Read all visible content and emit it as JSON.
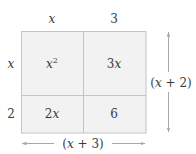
{
  "diagram": {
    "colors": {
      "cell_fill": "#f2f2f2",
      "grid_stroke": "#c4c4c4",
      "arrow_stroke": "#a8a8a8",
      "text": "#3a3a3a",
      "background": "#ffffff"
    },
    "column_headers": [
      {
        "text": "x",
        "italic": true
      },
      {
        "text": "3",
        "italic": false
      }
    ],
    "row_headers": [
      {
        "text": "x",
        "italic": true
      },
      {
        "text": "2",
        "italic": false
      }
    ],
    "cells": [
      {
        "row": 0,
        "col": 0,
        "coef": "",
        "var": "x",
        "sup": "2"
      },
      {
        "row": 0,
        "col": 1,
        "coef": "3",
        "var": "x",
        "sup": ""
      },
      {
        "row": 1,
        "col": 0,
        "coef": "2",
        "var": "x",
        "sup": ""
      },
      {
        "row": 1,
        "col": 1,
        "coef": "6",
        "var": "",
        "sup": ""
      }
    ],
    "width_label": {
      "open": "(",
      "var": "x",
      "rest": " + 3)"
    },
    "height_label": {
      "open": "(",
      "var": "x",
      "rest": " + 2)"
    }
  }
}
